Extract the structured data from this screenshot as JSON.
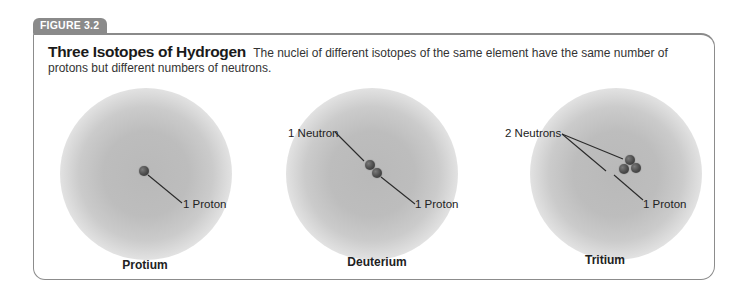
{
  "figure": {
    "label": "FIGURE 3.2",
    "title": "Three Isotopes of Hydrogen",
    "caption": "The nuclei of different isotopes of the same element have the same number of protons but different numbers of neutrons."
  },
  "isotopes": [
    {
      "name": "Protium",
      "labels": {
        "proton": "1 Proton"
      }
    },
    {
      "name": "Deuterium",
      "labels": {
        "neutron": "1 Neutron",
        "proton": "1 Proton"
      }
    },
    {
      "name": "Tritium",
      "labels": {
        "neutron": "2 Neutrons",
        "proton": "1 Proton"
      }
    }
  ]
}
